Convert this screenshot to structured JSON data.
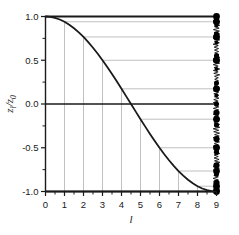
{
  "chart_data": {
    "type": "line",
    "title": "",
    "xlabel": "l",
    "ylabel": "z_l/z_0",
    "ylabel_parts": {
      "main1": "z",
      "sub1": "l",
      "slash": "/",
      "main2": "z",
      "sub2": "0"
    },
    "xlim": [
      0,
      9
    ],
    "ylim": [
      -1.0,
      1.0
    ],
    "grid": true,
    "grid_style": "projection-lines-from-curve",
    "legend": null,
    "xticks": [
      0,
      1,
      2,
      3,
      4,
      5,
      6,
      7,
      8,
      9
    ],
    "xticklabels": [
      "0",
      "1",
      "2",
      "3",
      "4",
      "5",
      "6",
      "7",
      "8",
      "9"
    ],
    "yticks": [
      -1.0,
      -0.5,
      0.0,
      0.5,
      1.0
    ],
    "yticklabels": [
      "-1.0",
      "-0.5",
      "0.0",
      "0.5",
      "1.0"
    ],
    "yminorticks": [
      -0.75,
      -0.25,
      0.25,
      0.75
    ],
    "curve": {
      "name": "cos(pi*l/9)",
      "expression": "z_l/z_0 = cos(pi*l/9)",
      "color": "#1a1a1a",
      "width": 1.8,
      "x": [
        0,
        0.25,
        0.5,
        0.75,
        1,
        1.25,
        1.5,
        1.75,
        2,
        2.25,
        2.5,
        2.75,
        3,
        3.25,
        3.5,
        3.75,
        4,
        4.25,
        4.5,
        4.75,
        5,
        5.25,
        5.5,
        5.75,
        6,
        6.25,
        6.5,
        6.75,
        7,
        7.25,
        7.5,
        7.75,
        8,
        8.25,
        8.5,
        8.75,
        9
      ],
      "y": [
        1.0,
        0.9962,
        0.9848,
        0.9659,
        0.9397,
        0.9063,
        0.866,
        0.8192,
        0.766,
        0.7071,
        0.6428,
        0.5736,
        0.5,
        0.4226,
        0.342,
        0.2588,
        0.1736,
        0.0872,
        0.0,
        -0.0872,
        -0.1736,
        -0.2588,
        -0.342,
        -0.4226,
        -0.5,
        -0.5736,
        -0.6428,
        -0.7071,
        -0.766,
        -0.8192,
        -0.866,
        -0.9063,
        -0.9397,
        -0.9659,
        -0.9848,
        -0.9962,
        -1.0
      ]
    },
    "level_markers": {
      "description": "Integer l values projected to horizontal lines ending in filled circle markers at l=9",
      "marker_color": "#000000",
      "marker_shape": "filled-circle",
      "levels": [
        {
          "l": 0,
          "value": 1.0
        },
        {
          "l": 1,
          "value": 0.9397
        },
        {
          "l": 2,
          "value": 0.766
        },
        {
          "l": 3,
          "value": 0.5
        },
        {
          "l": 4,
          "value": 0.1736
        },
        {
          "l": 5,
          "value": -0.1736
        },
        {
          "l": 6,
          "value": -0.5
        },
        {
          "l": 7,
          "value": -0.766
        },
        {
          "l": 8,
          "value": -0.9397
        },
        {
          "l": 9,
          "value": -1.0
        }
      ]
    },
    "zero_line": {
      "value": 0.0,
      "color": "#1a1a1a"
    },
    "dense_spectrum": {
      "description": "Dense cluster of energy levels drawn as a ragged vertical band of filled circles at l = 9",
      "x": 9,
      "count": 120,
      "range": [
        -1.0,
        1.0
      ]
    }
  }
}
